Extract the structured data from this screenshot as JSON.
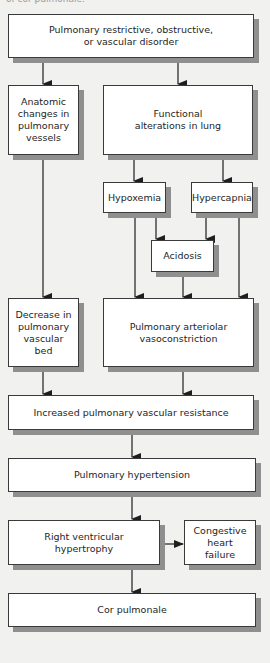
{
  "caption": "of cor pulmonale.",
  "nodes": {
    "disorder": "Pulmonary restrictive, obstructive,\nor vascular disorder",
    "anatomic": "Anatomic\nchanges in\npulmonary\nvessels",
    "functional": "Functional\nalterations in lung",
    "hypoxemia": "Hypoxemia",
    "hypercapnia": "Hypercapnia",
    "acidosis": "Acidosis",
    "decrease_bed": "Decrease in\npulmonary\nvascular\nbed",
    "vasoconstriction": "Pulmonary arteriolar\nvasoconstriction",
    "increased_pvr": "Increased pulmonary vascular resistance",
    "pulm_htn": "Pulmonary hypertension",
    "rvh": "Right ventricular\nhypertrophy",
    "chf": "Congestive\nheart\nfailure",
    "cor_pulmonale": "Cor pulmonale"
  },
  "edges": [
    [
      "disorder",
      "anatomic"
    ],
    [
      "disorder",
      "functional"
    ],
    [
      "anatomic",
      "decrease_bed"
    ],
    [
      "functional",
      "hypoxemia"
    ],
    [
      "functional",
      "hypercapnia"
    ],
    [
      "hypoxemia",
      "acidosis"
    ],
    [
      "hypercapnia",
      "acidosis"
    ],
    [
      "hypoxemia",
      "vasoconstriction"
    ],
    [
      "acidosis",
      "vasoconstriction"
    ],
    [
      "hypercapnia",
      "vasoconstriction"
    ],
    [
      "decrease_bed",
      "increased_pvr"
    ],
    [
      "vasoconstriction",
      "increased_pvr"
    ],
    [
      "increased_pvr",
      "pulm_htn"
    ],
    [
      "pulm_htn",
      "rvh"
    ],
    [
      "rvh",
      "chf"
    ],
    [
      "rvh",
      "cor_pulmonale"
    ]
  ],
  "colors": {
    "background": "#f1f1ef",
    "box_fill": "#ffffff",
    "box_border": "#3a3a3a",
    "shadow": "#8f8f8f",
    "arrow": "#1e1e1e"
  }
}
